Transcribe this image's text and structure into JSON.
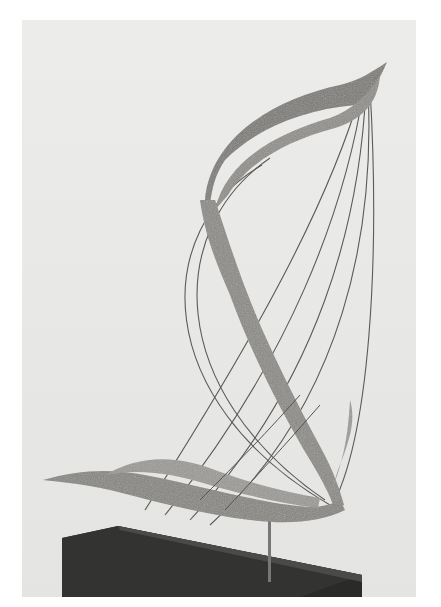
{
  "image": {
    "subject": "Abstract sculpture with twisting textured ribbon forms strung with thin wires, mounted on a dark rectangular base",
    "colors": {
      "background_page": "#ffffff",
      "photo_backdrop": "#e9e9e7",
      "ribbon": "#8c8a86",
      "ribbon_dark": "#6f6d69",
      "wire": "#5a5a5a",
      "base_top": "#4a4a48",
      "base_front": "#2a2a29",
      "rod": "#777777"
    }
  }
}
